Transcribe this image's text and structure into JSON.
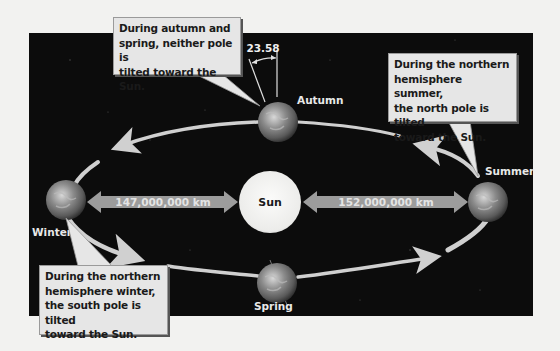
{
  "diagram": {
    "type": "earth-orbit-seasons",
    "colors": {
      "space": "#0c0c0c",
      "page": "#f2f2f0",
      "callout_fill": "#e6e6e6",
      "sun_fill": "#f4f4f2",
      "distance_arrow": "#9c9c9c",
      "orbit_arrow": "#d0d0d0"
    },
    "sun": {
      "label": "Sun"
    },
    "earth_positions": [
      {
        "id": "autumn",
        "label": "Autumn"
      },
      {
        "id": "summer",
        "label": "Summer"
      },
      {
        "id": "spring",
        "label": "Spring"
      },
      {
        "id": "winter",
        "label": "Winter"
      }
    ],
    "tilt_angle_label": "23.58",
    "distances": {
      "winter_to_sun": "147,000,000 km",
      "sun_to_summer": "152,000,000 km"
    },
    "callouts": {
      "autumn_spring": "During autumn and\nspring, neither pole is\ntilted toward the Sun.",
      "summer": "During the northern\nhemisphere summer,\nthe north pole is tilted\ntoward the Sun.",
      "winter": "During the northern\nhemisphere winter,\nthe south pole is tilted\ntoward the Sun."
    }
  }
}
